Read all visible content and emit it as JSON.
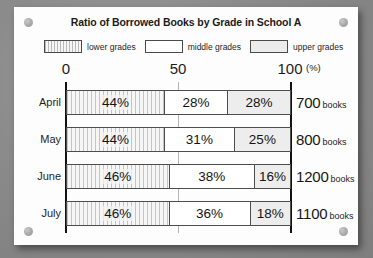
{
  "chart_data": {
    "type": "bar",
    "orientation": "horizontal",
    "stacked": true,
    "title": "Ratio of Borrowed Books by Grade in School A",
    "xlabel": "",
    "ylabel": "",
    "unit": "(%)",
    "xlim": [
      0,
      100
    ],
    "xticks": [
      "0",
      "50",
      "100"
    ],
    "xtick_values": [
      0,
      50,
      100
    ],
    "grid": true,
    "legend_position": "top",
    "categories": [
      "April",
      "May",
      "June",
      "July"
    ],
    "series": [
      {
        "name": "lower grades",
        "values": [
          44,
          44,
          46,
          46
        ]
      },
      {
        "name": "middle grades",
        "values": [
          28,
          31,
          38,
          36
        ]
      },
      {
        "name": "upper grades",
        "values": [
          28,
          25,
          16,
          18
        ]
      }
    ],
    "totals": [
      {
        "value": "700",
        "unit": "books"
      },
      {
        "value": "800",
        "unit": "books"
      },
      {
        "value": "1200",
        "unit": "books"
      },
      {
        "value": "1100",
        "unit": "books"
      }
    ],
    "rows": [
      {
        "label": "April",
        "segments": [
          {
            "series": "lower grades",
            "label": "44%",
            "value": 44
          },
          {
            "series": "middle grades",
            "label": "28%",
            "value": 28
          },
          {
            "series": "upper grades",
            "label": "28%",
            "value": 28
          }
        ],
        "total": "700",
        "total_unit": "books"
      },
      {
        "label": "May",
        "segments": [
          {
            "series": "lower grades",
            "label": "44%",
            "value": 44
          },
          {
            "series": "middle grades",
            "label": "31%",
            "value": 31
          },
          {
            "series": "upper grades",
            "label": "25%",
            "value": 25
          }
        ],
        "total": "800",
        "total_unit": "books"
      },
      {
        "label": "June",
        "segments": [
          {
            "series": "lower grades",
            "label": "46%",
            "value": 46
          },
          {
            "series": "middle grades",
            "label": "38%",
            "value": 38
          },
          {
            "series": "upper grades",
            "label": "16%",
            "value": 16
          }
        ],
        "total": "1200",
        "total_unit": "books"
      },
      {
        "label": "July",
        "segments": [
          {
            "series": "lower grades",
            "label": "46%",
            "value": 46
          },
          {
            "series": "middle grades",
            "label": "36%",
            "value": 36
          },
          {
            "series": "upper grades",
            "label": "18%",
            "value": 18
          }
        ],
        "total": "1100",
        "total_unit": "books"
      }
    ]
  },
  "legend": {
    "items": [
      {
        "label": "lower grades",
        "pattern": "hatched",
        "color": "#f4f4f4"
      },
      {
        "label": "middle grades",
        "pattern": "solid",
        "color": "#ffffff"
      },
      {
        "label": "upper grades",
        "pattern": "solid-gray",
        "color": "#ececec"
      }
    ]
  },
  "colors": {
    "backdrop": "#8a8a8a",
    "card": "#fdfdfd",
    "axis": "#111111",
    "gridline": "#b4b4b4",
    "text": "#1b1b1b",
    "lower_grades": "#f4f4f4",
    "middle_grades": "#ffffff",
    "upper_grades": "#ececec",
    "screw": "#a8a8a8"
  },
  "decor": {
    "screws": [
      "top-left",
      "top-right",
      "bottom-left",
      "bottom-right"
    ]
  }
}
